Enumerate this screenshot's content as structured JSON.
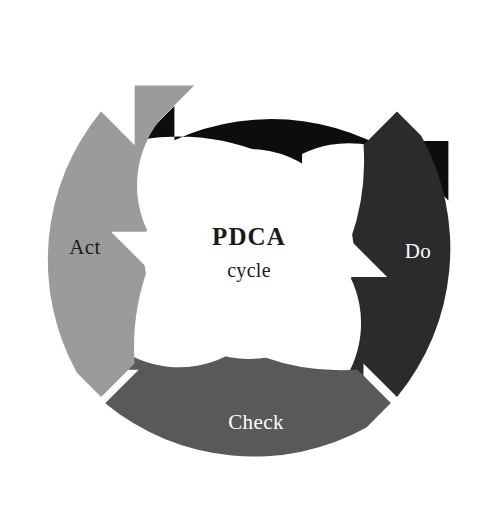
{
  "diagram": {
    "type": "cycle-diagram",
    "name": "PDCA cycle diagram",
    "background_color": "#ffffff",
    "center": {
      "title": "PDCA",
      "subtitle": "cycle",
      "text_color": "#1a1a1a",
      "fill_color": "#ffffff"
    },
    "geometry": {
      "center_x": 249,
      "center_y": 254,
      "outer_radius": 233,
      "inner_radius": 105
    },
    "sectors": [
      {
        "id": "plan",
        "label": "Plan",
        "color": "#0d0d0d",
        "label_color": "#ffffff",
        "position": "top",
        "order": 1,
        "label_x": 249,
        "label_y": 86,
        "start_angle": -115,
        "end_angle": -25,
        "points_to": "do"
      },
      {
        "id": "do",
        "label": "Do",
        "color": "#2b2b2b",
        "label_color": "#ffffff",
        "position": "right",
        "order": 2,
        "label_x": 418,
        "label_y": 253,
        "start_angle": -25,
        "end_angle": 65,
        "points_to": "check"
      },
      {
        "id": "check",
        "label": "Check",
        "color": "#595959",
        "label_color": "#ffffff",
        "position": "bottom",
        "order": 3,
        "label_x": 256,
        "label_y": 424,
        "start_angle": 65,
        "end_angle": 155,
        "points_to": "act"
      },
      {
        "id": "act",
        "label": "Act",
        "color": "#9b9b9b",
        "label_color": "#1a1a1a",
        "position": "left",
        "order": 4,
        "label_x": 85,
        "label_y": 249,
        "start_angle": 155,
        "end_angle": 245,
        "points_to": "plan"
      }
    ]
  },
  "chart_data": {
    "type": "pie",
    "title": "PDCA cycle",
    "categories": [
      "Plan",
      "Do",
      "Check",
      "Act"
    ],
    "values": [
      25,
      25,
      25,
      25
    ],
    "colors": [
      "#0d0d0d",
      "#2b2b2b",
      "#595959",
      "#9b9b9b"
    ],
    "xlabel": "",
    "ylabel": "",
    "legend": "none",
    "grid": false,
    "annotations": [
      "PDCA",
      "cycle"
    ]
  }
}
